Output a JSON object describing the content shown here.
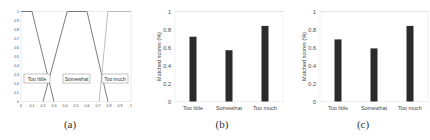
{
  "captions": [
    "(a)",
    "(b)",
    "(c)"
  ],
  "chart_data": [
    {
      "type": "line",
      "title": "",
      "xlabel": "",
      "ylabel": "",
      "xlim": [
        0,
        1
      ],
      "ylim": [
        0,
        1
      ],
      "xticks": [
        "0",
        "0.1",
        "0.2",
        "0.3",
        "0.4",
        "0.5",
        "0.6",
        "0.7",
        "0.8",
        "0.9",
        "1"
      ],
      "yticks": [
        "0",
        "0.1",
        "0.2",
        "0.3",
        "0.4",
        "0.5",
        "0.6",
        "0.7",
        "0.8",
        "0.9",
        "1"
      ],
      "grid": false,
      "series": [
        {
          "name": "Too little",
          "x": [
            0,
            0.1,
            0.3
          ],
          "y": [
            1,
            1,
            0
          ]
        },
        {
          "name": "Somewhat",
          "x": [
            0.2,
            0.42,
            0.6,
            0.79
          ],
          "y": [
            0,
            1,
            1,
            0
          ]
        },
        {
          "name": "Too much",
          "x": [
            0.71,
            0.79,
            1
          ],
          "y": [
            0,
            1,
            1
          ]
        }
      ],
      "annotations": [
        "Too little",
        "Somewhat",
        "Too much"
      ]
    },
    {
      "type": "bar",
      "title": "",
      "xlabel": "",
      "ylabel": "Matched scores (%)",
      "categories": [
        "Too little",
        "Somewhat",
        "Too much"
      ],
      "values": [
        0.72,
        0.57,
        0.84
      ],
      "ylim": [
        0,
        1
      ],
      "yticks": [
        "0",
        "0.2",
        "0.4",
        "0.6",
        "0.8",
        "1"
      ],
      "grid": false
    },
    {
      "type": "bar",
      "title": "",
      "xlabel": "",
      "ylabel": "Matched scores (%)",
      "categories": [
        "Too little",
        "Somewhat",
        "Too much"
      ],
      "values": [
        0.69,
        0.59,
        0.84
      ],
      "ylim": [
        0,
        1
      ],
      "yticks": [
        "0",
        "0.2",
        "0.4",
        "0.6",
        "0.8",
        "1"
      ],
      "grid": false
    }
  ],
  "colors": {
    "bar": "#2b2b2b",
    "line_dark": "#6e6e6e",
    "line_light": "#b5b5b5",
    "axis": "#999999",
    "text": "#444444"
  }
}
